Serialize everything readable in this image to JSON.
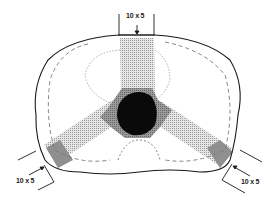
{
  "diagram": {
    "type": "radiotherapy-isodose-plan",
    "fields": [
      {
        "id": "anterior",
        "label": "10 x 5",
        "position": "top"
      },
      {
        "id": "left-posterior-oblique",
        "label": "10 x 5",
        "position": "bottom-left"
      },
      {
        "id": "right-posterior-oblique",
        "label": "10 x 5",
        "position": "bottom-right"
      }
    ],
    "colors": {
      "outline": "#1a1a1a",
      "beam_fill": "#c8c8c8",
      "high_dose": "#8a8a8a",
      "target": "#0a0a0a",
      "isodose_dash": "#777777"
    }
  }
}
